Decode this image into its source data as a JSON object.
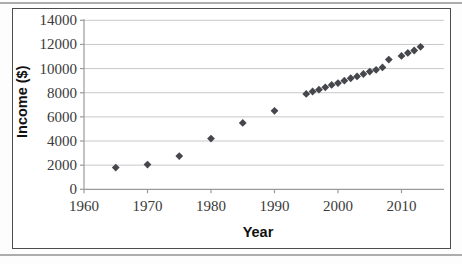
{
  "chart_data": {
    "type": "scatter",
    "title": "",
    "xlabel": "Year",
    "ylabel": "Income ($)",
    "x_ticks": [
      1960,
      1970,
      1980,
      1990,
      2000,
      2010
    ],
    "y_ticks": [
      0,
      2000,
      4000,
      6000,
      8000,
      10000,
      12000,
      14000
    ],
    "xlim": [
      1960,
      2016.5
    ],
    "ylim": [
      0,
      14000
    ],
    "grid": true,
    "legend_position": "none",
    "marker": "diamond",
    "points": [
      [
        1965,
        1800
      ],
      [
        1970,
        2050
      ],
      [
        1975,
        2750
      ],
      [
        1980,
        4200
      ],
      [
        1985,
        5500
      ],
      [
        1990,
        6500
      ],
      [
        1995,
        7900
      ],
      [
        1996,
        8100
      ],
      [
        1997,
        8250
      ],
      [
        1998,
        8450
      ],
      [
        1999,
        8650
      ],
      [
        2000,
        8800
      ],
      [
        2001,
        9000
      ],
      [
        2002,
        9200
      ],
      [
        2003,
        9350
      ],
      [
        2004,
        9550
      ],
      [
        2005,
        9750
      ],
      [
        2006,
        9900
      ],
      [
        2007,
        10100
      ],
      [
        2008,
        10750
      ],
      [
        2010,
        11050
      ],
      [
        2011,
        11300
      ],
      [
        2012,
        11500
      ],
      [
        2013,
        11800
      ]
    ]
  },
  "style": {
    "marker_color": "#46474c",
    "gridline_color": "#c8c8c8",
    "axis_color": "#9a9a9a",
    "tick_text_color": "#3a3a3a",
    "frame_border_color": "#4d4d4d",
    "edge_rule_color": "#adadad",
    "background": "#ffffff"
  }
}
